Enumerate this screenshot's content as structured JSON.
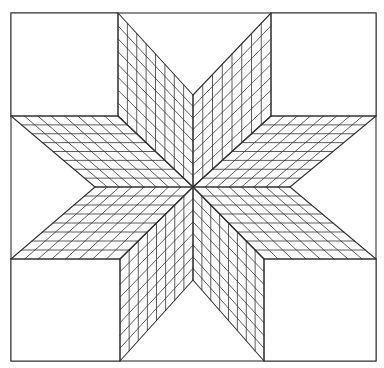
{
  "figure": {
    "title": "Eight-pointed star quilt pattern",
    "stroke_color": "#333333",
    "background_color": "#ffffff",
    "grid_divisions": 8,
    "border": {
      "x1": 11,
      "y1": 13,
      "x2": 376,
      "y2": 361
    },
    "center": [
      193,
      187
    ],
    "corner_squares": [
      {
        "name": "top-left",
        "x1": 11,
        "y1": 13,
        "x2": 118,
        "y2": 116
      },
      {
        "name": "top-right",
        "x1": 271,
        "y1": 13,
        "x2": 376,
        "y2": 116
      },
      {
        "name": "bottom-left",
        "x1": 11,
        "y1": 259,
        "x2": 120,
        "y2": 361
      },
      {
        "name": "bottom-right",
        "x1": 264,
        "y1": 259,
        "x2": 376,
        "y2": 361
      }
    ],
    "diamonds": [
      {
        "name": "top-left-point",
        "side_a": [
          193,
          95
        ],
        "tip": [
          118,
          13
        ],
        "side_b": [
          118,
          116
        ]
      },
      {
        "name": "top-right-point",
        "side_a": [
          271,
          116
        ],
        "tip": [
          271,
          13
        ],
        "side_b": [
          193,
          95
        ]
      },
      {
        "name": "right-upper-point",
        "side_a": [
          290,
          187
        ],
        "tip": [
          376,
          116
        ],
        "side_b": [
          271,
          116
        ]
      },
      {
        "name": "right-lower-point",
        "side_a": [
          264,
          259
        ],
        "tip": [
          376,
          259
        ],
        "side_b": [
          290,
          187
        ]
      },
      {
        "name": "bottom-right-point",
        "side_a": [
          193,
          280
        ],
        "tip": [
          264,
          361
        ],
        "side_b": [
          264,
          259
        ]
      },
      {
        "name": "bottom-left-point",
        "side_a": [
          120,
          259
        ],
        "tip": [
          120,
          361
        ],
        "side_b": [
          193,
          280
        ]
      },
      {
        "name": "left-lower-point",
        "side_a": [
          95,
          187
        ],
        "tip": [
          11,
          259
        ],
        "side_b": [
          120,
          259
        ]
      },
      {
        "name": "left-upper-point",
        "side_a": [
          118,
          116
        ],
        "tip": [
          11,
          116
        ],
        "side_b": [
          95,
          187
        ]
      }
    ]
  }
}
